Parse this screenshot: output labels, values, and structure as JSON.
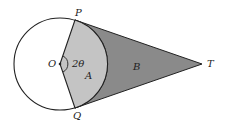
{
  "diagram": {
    "labels": {
      "P": "P",
      "Q": "Q",
      "O": "O",
      "T": "T",
      "angle": "2θ",
      "regionA": "A",
      "regionB": "B"
    },
    "colors": {
      "regionA": "#c4c4c4",
      "regionB": "#8a8a8a",
      "stroke": "#222222",
      "circle_fill": "#ffffff"
    },
    "geometry": {
      "center": [
        60,
        64
      ],
      "radius": 46,
      "P": [
        75,
        20
      ],
      "Q": [
        75,
        108
      ],
      "T": [
        202,
        64
      ]
    }
  }
}
